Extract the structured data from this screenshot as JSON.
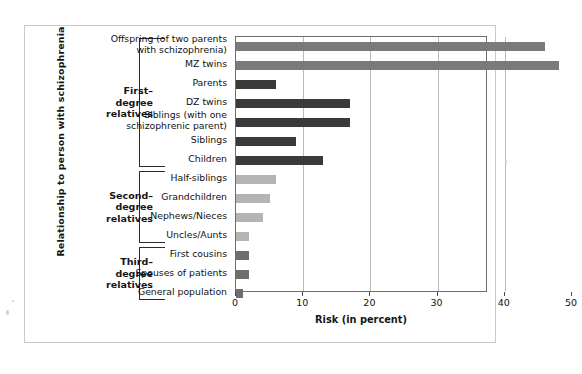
{
  "figure": {
    "y_axis_title": "Relationship to person with schizophrenia",
    "x_axis_title": "Risk (in percent)"
  },
  "groups": [
    {
      "id": "first-degree",
      "label": "First–\ndegree\nrelatives"
    },
    {
      "id": "second-degree",
      "label": "Second–\ndegree\nrelatives"
    },
    {
      "id": "third-degree",
      "label": "Third–\ndegree\nrelatives"
    }
  ],
  "colors": {
    "bar_medium_gray": "#7a7a7a",
    "bar_dark_gray": "#3a3a3a",
    "bar_light_gray": "#b4b4b4",
    "grid": "#b9b9b9",
    "axis": "#6f6f6f",
    "text": "#111111"
  },
  "chart_data": {
    "type": "bar",
    "orientation": "horizontal",
    "title": "",
    "xlabel": "Risk (in percent)",
    "ylabel": "Relationship to person with schizophrenia",
    "xlim": [
      0,
      50
    ],
    "xticks": [
      0,
      10,
      20,
      30,
      40,
      50
    ],
    "grid": true,
    "legend": "none",
    "categories": [
      "Offspring (of two parents\nwith schizophrenia)",
      "MZ twins",
      "Parents",
      "DZ twins",
      "Siblings (with one\nschizophrenic parent)",
      "Siblings",
      "Children",
      "Half-siblings",
      "Grandchildren",
      "Nephews/Nieces",
      "Uncles/Aunts",
      "First cousins",
      "Spouses  of patients",
      "General population"
    ],
    "values": [
      46,
      48,
      6,
      17,
      17,
      9,
      13,
      6,
      5,
      4,
      2,
      2,
      2,
      1
    ],
    "bar_colors": [
      "#7a7a7a",
      "#7a7a7a",
      "#3a3a3a",
      "#3a3a3a",
      "#3a3a3a",
      "#3a3a3a",
      "#3a3a3a",
      "#b4b4b4",
      "#b4b4b4",
      "#b4b4b4",
      "#b4b4b4",
      "#6e6e6e",
      "#6e6e6e",
      "#6e6e6e"
    ],
    "group_membership": [
      "first-degree",
      "first-degree",
      "first-degree",
      "first-degree",
      "first-degree",
      "first-degree",
      "first-degree",
      "second-degree",
      "second-degree",
      "second-degree",
      "second-degree",
      "third-degree",
      "third-degree",
      "third-degree"
    ]
  }
}
